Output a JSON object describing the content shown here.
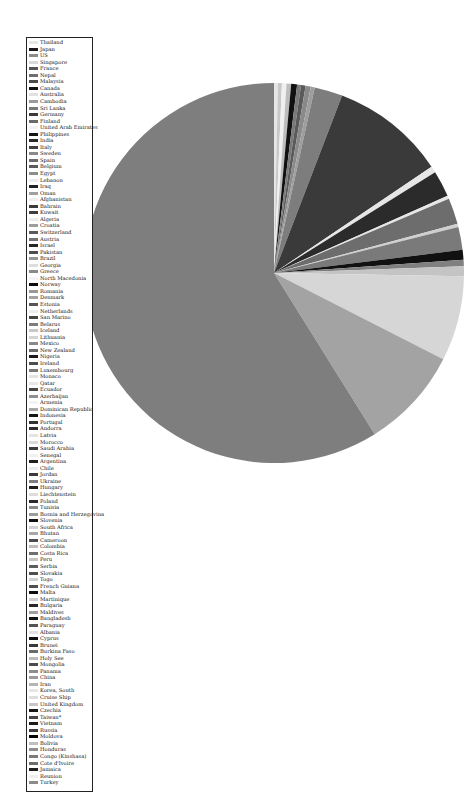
{
  "chart_data": {
    "type": "pie",
    "title": "",
    "legend_position": "left",
    "grid": false,
    "startangle_deg": 0,
    "direction": "clockwise-from-top (approx)",
    "categories": [
      "Thailand",
      "Japan",
      "US",
      "Singapore",
      "France",
      "Nepal",
      "Malaysia",
      "Canada",
      "Australia",
      "Cambodia",
      "Sri Lanka",
      "Germany",
      "Finland",
      "United Arab Emirates",
      "Philippines",
      "India",
      "Italy",
      "Sweden",
      "Spain",
      "Belgium",
      "Egypt",
      "Lebanon",
      "Iraq",
      "Oman",
      "Afghanistan",
      "Bahrain",
      "Kuwait",
      "Algeria",
      "Croatia",
      "Switzerland",
      "Austria",
      "Israel",
      "Pakistan",
      "Brazil",
      "Georgia",
      "Greece",
      "North Macedonia",
      "Norway",
      "Romania",
      "Denmark",
      "Estonia",
      "Netherlands",
      "San Marino",
      "Belarus",
      "Iceland",
      "Lithuania",
      "Mexico",
      "New Zealand",
      "Nigeria",
      "Ireland",
      "Luxembourg",
      "Monaco",
      "Qatar",
      "Ecuador",
      "Azerbaijan",
      "Armenia",
      "Dominican Republic",
      "Indonesia",
      "Portugal",
      "Andorra",
      "Latvia",
      "Morocco",
      "Saudi Arabia",
      "Senegal",
      "Argentina",
      "Chile",
      "Jordan",
      "Ukraine",
      "Hungary",
      "Liechtenstein",
      "Poland",
      "Tunisia",
      "Bosnia and Herzegovina",
      "Slovenia",
      "South Africa",
      "Bhutan",
      "Cameroon",
      "Colombia",
      "Costa Rica",
      "Peru",
      "Serbia",
      "Slovakia",
      "Togo",
      "French Guiana",
      "Malta",
      "Martinique",
      "Bulgaria",
      "Maldives",
      "Bangladesh",
      "Paraguay",
      "Albania",
      "Cyprus",
      "Brunei",
      "Burkina Faso",
      "Holy See",
      "Mongolia",
      "Panama",
      "China",
      "Iran",
      "Korea, South",
      "Cruise Ship",
      "United Kingdom",
      "Czechia",
      "Taiwan*",
      "Vietnam",
      "Russia",
      "Moldova",
      "Bolivia",
      "Honduras",
      "Congo (Kinshasa)",
      "Cote d'Ivoire",
      "Jamaica",
      "Reunion",
      "Turkey"
    ],
    "slices_approx_percent": [
      {
        "label": "Thailand",
        "value": 0.3
      },
      {
        "label": "Japan",
        "value": 0.5
      },
      {
        "label": "US",
        "value": 0.4
      },
      {
        "label": "Singapore",
        "value": 0.3
      },
      {
        "label": "France",
        "value": 0.6
      },
      {
        "label": "Nepal",
        "value": 0.2
      },
      {
        "label": "Malaysia",
        "value": 0.4
      },
      {
        "label": "Canada",
        "value": 0.3
      },
      {
        "label": "Australia",
        "value": 0.3
      },
      {
        "label": "Cambodia",
        "value": 0.2
      },
      {
        "label": "Sri Lanka",
        "value": 0.2
      },
      {
        "label": "Germany",
        "value": 2.2
      },
      {
        "label": "Finland",
        "value": 0.2
      },
      {
        "label": "Italy",
        "value": 10.0
      },
      {
        "label": "Iraq",
        "value": 1.4
      },
      {
        "label": "Spain",
        "value": 2.0
      },
      {
        "label": "Switzerland",
        "value": 0.8
      },
      {
        "label": "Iran",
        "value": 6.5
      },
      {
        "label": "Korea, South",
        "value": 7.5
      },
      {
        "label": "China",
        "value": 65.0
      },
      {
        "label": "Others (many <0.1%)",
        "value": 0.7
      }
    ],
    "colors_note": "grayscale palette, repeated shades",
    "pie_center_px": [
      274,
      273
    ],
    "pie_radius_px": 190
  },
  "legend": {
    "entries": [
      {
        "label": "Thailand",
        "color": "#e6e6e6"
      },
      {
        "label": "Japan",
        "color": "#1a1a1a"
      },
      {
        "label": "US",
        "color": "#8c8c8c"
      },
      {
        "label": "Singapore",
        "color": "#d9d9d9"
      },
      {
        "label": "France",
        "color": "#555555"
      },
      {
        "label": "Nepal",
        "color": "#6e6e6e"
      },
      {
        "label": "Malaysia",
        "color": "#4a4a4a"
      },
      {
        "label": "Canada",
        "color": "#111111"
      },
      {
        "label": "Australia",
        "color": "#e0e0e0"
      },
      {
        "label": "Cambodia",
        "color": "#9a9a9a"
      },
      {
        "label": "Sri Lanka",
        "color": "#7a7a7a"
      },
      {
        "label": "Germany",
        "color": "#3a3a3a"
      },
      {
        "label": "Finland",
        "color": "#6a6a6a"
      },
      {
        "label": "United Arab Emirates",
        "color": "#f2f2f2"
      },
      {
        "label": "Philippines",
        "color": "#151515"
      },
      {
        "label": "India",
        "color": "#2a2a2a"
      },
      {
        "label": "Italy",
        "color": "#404040"
      },
      {
        "label": "Sweden",
        "color": "#8a8a8a"
      },
      {
        "label": "Spain",
        "color": "#6c6c6c"
      },
      {
        "label": "Belgium",
        "color": "#5c5c5c"
      },
      {
        "label": "Egypt",
        "color": "#8e8e8e"
      },
      {
        "label": "Lebanon",
        "color": "#ededed"
      },
      {
        "label": "Iraq",
        "color": "#222222"
      },
      {
        "label": "Oman",
        "color": "#a0a0a0"
      },
      {
        "label": "Afghanistan",
        "color": "#f0f0f0"
      },
      {
        "label": "Bahrain",
        "color": "#3c3c3c"
      },
      {
        "label": "Kuwait",
        "color": "#3f3f3f"
      },
      {
        "label": "Algeria",
        "color": "#ececec"
      },
      {
        "label": "Croatia",
        "color": "#9e9e9e"
      },
      {
        "label": "Switzerland",
        "color": "#5a5a5a"
      },
      {
        "label": "Austria",
        "color": "#737373"
      },
      {
        "label": "Israel",
        "color": "#262626"
      },
      {
        "label": "Pakistan",
        "color": "#4e4e4e"
      },
      {
        "label": "Brazil",
        "color": "#969696"
      },
      {
        "label": "Georgia",
        "color": "#dedede"
      },
      {
        "label": "Greece",
        "color": "#8a8a8a"
      },
      {
        "label": "North Macedonia",
        "color": "#f5f5f5"
      },
      {
        "label": "Norway",
        "color": "#0d0d0d"
      },
      {
        "label": "Romania",
        "color": "#999999"
      },
      {
        "label": "Denmark",
        "color": "#a3a3a3"
      },
      {
        "label": "Estonia",
        "color": "#555555"
      },
      {
        "label": "Netherlands",
        "color": "#ededed"
      },
      {
        "label": "San Marino",
        "color": "#454545"
      },
      {
        "label": "Belarus",
        "color": "#7d7d7d"
      },
      {
        "label": "Iceland",
        "color": "#c8c8c8"
      },
      {
        "label": "Lithuania",
        "color": "#d4d4d4"
      },
      {
        "label": "Mexico",
        "color": "#888888"
      },
      {
        "label": "New Zealand",
        "color": "#6b6b6b"
      },
      {
        "label": "Nigeria",
        "color": "#1c1c1c"
      },
      {
        "label": "Ireland",
        "color": "#4d4d4d"
      },
      {
        "label": "Luxembourg",
        "color": "#7a7a7a"
      },
      {
        "label": "Monaco",
        "color": "#e3e3e3"
      },
      {
        "label": "Qatar",
        "color": "#e8e8e8"
      },
      {
        "label": "Ecuador",
        "color": "#474747"
      },
      {
        "label": "Azerbaijan",
        "color": "#909090"
      },
      {
        "label": "Armenia",
        "color": "#f3f3f3"
      },
      {
        "label": "Dominican Republic",
        "color": "#a6a6a6"
      },
      {
        "label": "Indonesia",
        "color": "#161616"
      },
      {
        "label": "Portugal",
        "color": "#333333"
      },
      {
        "label": "Andorra",
        "color": "#2e2e2e"
      },
      {
        "label": "Latvia",
        "color": "#e4e4e4"
      },
      {
        "label": "Morocco",
        "color": "#dadada"
      },
      {
        "label": "Saudi Arabia",
        "color": "#3d3d3d"
      },
      {
        "label": "Senegal",
        "color": "#f1f1f1"
      },
      {
        "label": "Argentina",
        "color": "#1f1f1f"
      },
      {
        "label": "Chile",
        "color": "#ebebeb"
      },
      {
        "label": "Jordan",
        "color": "#3a3a3a"
      },
      {
        "label": "Ukraine",
        "color": "#7f7f7f"
      },
      {
        "label": "Hungary",
        "color": "#202020"
      },
      {
        "label": "Liechtenstein",
        "color": "#dcdcdc"
      },
      {
        "label": "Poland",
        "color": "#2b2b2b"
      },
      {
        "label": "Tunisia",
        "color": "#8b8b8b"
      },
      {
        "label": "Bosnia and Herzegovina",
        "color": "#9b9b9b"
      },
      {
        "label": "Slovenia",
        "color": "#121212"
      },
      {
        "label": "South Africa",
        "color": "#d2d2d2"
      },
      {
        "label": "Bhutan",
        "color": "#a8a8a8"
      },
      {
        "label": "Cameroon",
        "color": "#4b4b4b"
      },
      {
        "label": "Colombia",
        "color": "#bdbdbd"
      },
      {
        "label": "Costa Rica",
        "color": "#6f6f6f"
      },
      {
        "label": "Peru",
        "color": "#c4c4c4"
      },
      {
        "label": "Serbia",
        "color": "#5e5e5e"
      },
      {
        "label": "Slovakia",
        "color": "#4f4f4f"
      },
      {
        "label": "Togo",
        "color": "#d0d0d0"
      },
      {
        "label": "French Guiana",
        "color": "#505050"
      },
      {
        "label": "Malta",
        "color": "#0f0f0f"
      },
      {
        "label": "Martinique",
        "color": "#cfcfcf"
      },
      {
        "label": "Bulgaria",
        "color": "#292929"
      },
      {
        "label": "Maldives",
        "color": "#a1a1a1"
      },
      {
        "label": "Bangladesh",
        "color": "#141414"
      },
      {
        "label": "Paraguay",
        "color": "#545454"
      },
      {
        "label": "Albania",
        "color": "#e2e2e2"
      },
      {
        "label": "Cyprus",
        "color": "#101010"
      },
      {
        "label": "Brunei",
        "color": "#383838"
      },
      {
        "label": "Burkina Faso",
        "color": "#6a6a6a"
      },
      {
        "label": "Holy See",
        "color": "#bcbcbc"
      },
      {
        "label": "Mongolia",
        "color": "#4c4c4c"
      },
      {
        "label": "Panama",
        "color": "#8d8d8d"
      },
      {
        "label": "China",
        "color": "#9c9c9c"
      },
      {
        "label": "Iran",
        "color": "#b5b5b5"
      },
      {
        "label": "Korea, South",
        "color": "#e6e6e6"
      },
      {
        "label": "Cruise Ship",
        "color": "#dedede"
      },
      {
        "label": "United Kingdom",
        "color": "#c6c6c6"
      },
      {
        "label": "Czechia",
        "color": "#181818"
      },
      {
        "label": "Taiwan*",
        "color": "#464646"
      },
      {
        "label": "Vietnam",
        "color": "#1b1b1b"
      },
      {
        "label": "Russia",
        "color": "#3b3b3b"
      },
      {
        "label": "Moldova",
        "color": "#050505"
      },
      {
        "label": "Bolivia",
        "color": "#bfbfbf"
      },
      {
        "label": "Honduras",
        "color": "#8f8f8f"
      },
      {
        "label": "Congo (Kinshasa)",
        "color": "#7b7b7b"
      },
      {
        "label": "Cote d'Ivoire",
        "color": "#6d6d6d"
      },
      {
        "label": "Jamaica",
        "color": "#1e1e1e"
      },
      {
        "label": "Reunion",
        "color": "#efefef"
      },
      {
        "label": "Turkey",
        "color": "#8c8c8c"
      }
    ]
  },
  "pie": {
    "slices": [
      {
        "label": "Thailand",
        "start": 0.0,
        "end": 1.2,
        "color": "#e6e6e6"
      },
      {
        "label": "Japan",
        "start": 1.2,
        "end": 2.4,
        "color": "#c8c8c8"
      },
      {
        "label": "US",
        "start": 2.4,
        "end": 3.8,
        "color": "#f0f0f0"
      },
      {
        "label": "Singapore",
        "start": 3.8,
        "end": 5.2,
        "color": "#bdbdbd"
      },
      {
        "label": "France",
        "start": 5.2,
        "end": 7.0,
        "color": "#111111"
      },
      {
        "label": "Nepal",
        "start": 7.0,
        "end": 8.2,
        "color": "#7a7a7a"
      },
      {
        "label": "Malaysia",
        "start": 8.2,
        "end": 9.6,
        "color": "#5a5a5a"
      },
      {
        "label": "Canada",
        "start": 9.6,
        "end": 11.2,
        "color": "#8a8a8a"
      },
      {
        "label": "Australia",
        "start": 11.2,
        "end": 12.4,
        "color": "#9e9e9e"
      },
      {
        "label": "Germany",
        "start": 12.4,
        "end": 21.0,
        "color": "#7d7d7d"
      },
      {
        "label": "Italy",
        "start": 21.0,
        "end": 56.0,
        "color": "#3a3a3a"
      },
      {
        "label": "Iraq",
        "start": 56.0,
        "end": 58.0,
        "color": "#e6e6e6"
      },
      {
        "label": "Iran-dark",
        "start": 58.0,
        "end": 66.0,
        "color": "#2b2b2b"
      },
      {
        "label": "Spain-line",
        "start": 66.0,
        "end": 67.0,
        "color": "#e6e6e6"
      },
      {
        "label": "Switzerland",
        "start": 67.0,
        "end": 75.0,
        "color": "#6d6d6d"
      },
      {
        "label": "Belgium-line",
        "start": 75.0,
        "end": 76.0,
        "color": "#cfcfcf"
      },
      {
        "label": "Sweden",
        "start": 76.0,
        "end": 83.0,
        "color": "#7a7a7a"
      },
      {
        "label": "Norway",
        "start": 83.0,
        "end": 86.0,
        "color": "#111111"
      },
      {
        "label": "Denmark",
        "start": 86.0,
        "end": 88.0,
        "color": "#808080"
      },
      {
        "label": "Netherlands",
        "start": 88.0,
        "end": 91.0,
        "color": "#c4c4c4"
      },
      {
        "label": "Korea, South",
        "start": 91.0,
        "end": 117.0,
        "color": "#d6d6d6"
      },
      {
        "label": "Iran",
        "start": 117.0,
        "end": 148.0,
        "color": "#a3a3a3"
      },
      {
        "label": "China",
        "start": 148.0,
        "end": 360.0,
        "color": "#7e7e7e"
      }
    ]
  }
}
